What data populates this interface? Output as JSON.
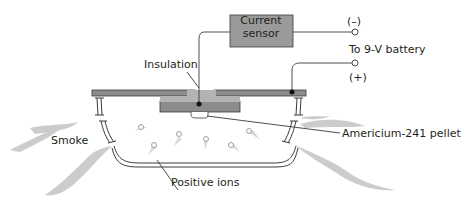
{
  "diagram": {
    "labels": {
      "current_sensor": "Current sensor",
      "minus": "(–)",
      "battery": "To 9-V battery",
      "plus": "(+)",
      "insulation": "Insulation",
      "smoke": "Smoke",
      "americium": "Americium-241 pellet",
      "positive_ions": "Positive ions"
    },
    "colors": {
      "plate": "#8c8c8c",
      "insulation": "#b3b3b3",
      "sensor_box": "#9a9a9a",
      "smoke": "#bdbdbd",
      "line": "#3a3a3a"
    }
  }
}
